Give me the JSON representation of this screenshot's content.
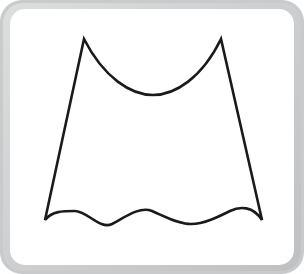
{
  "canvas": {
    "width": 304,
    "height": 274,
    "background_color": "#ffffff"
  },
  "frame": {
    "name": "rounded-card-frame",
    "border_color": "#c9cacb",
    "bevel_color_light": "#dcdddd",
    "bevel_color_dark": "#bfc0c1",
    "corner_radius": 22,
    "border_thickness": 10
  },
  "card": {
    "name": "white-card",
    "background_color": "#ffffff",
    "corner_radius": 15,
    "x": 10,
    "y": 9,
    "width": 284,
    "height": 256
  },
  "figure": {
    "name": "scalloped-flared-shape",
    "stroke_color": "#1a1a1a",
    "fill_color": "none",
    "stroke_width": 2.6,
    "points": {
      "top_left_peak": {
        "x": 84,
        "y": 39
      },
      "top_right_peak": {
        "x": 221,
        "y": 39
      },
      "top_arc_lowest": {
        "x": 153,
        "y": 82
      },
      "bottom_left_vertex": {
        "x": 45,
        "y": 220
      },
      "bottom_right_vertex": {
        "x": 262,
        "y": 220
      },
      "hem_hump_1": {
        "x": 75,
        "y": 211
      },
      "hem_trough_1": {
        "x": 112,
        "y": 224
      },
      "hem_hump_2": {
        "x": 152,
        "y": 211
      },
      "hem_trough_2": {
        "x": 191,
        "y": 224
      },
      "hem_hump_3": {
        "x": 230,
        "y": 211
      }
    },
    "counts": {
      "top_peaks": 2,
      "top_arcs": 1,
      "hem_humps": 3,
      "hem_troughs": 2,
      "straight_sides": 2
    },
    "path_d": "M 84 39 C 104 78, 131 95, 153 95 C 175 95, 202 78, 221 39 L 262 220 C 253 206, 240 206, 230 211 C 218 217, 204 224, 191 224 C 178 224, 164 216, 152 211 C 140 206, 125 217, 112 224 C 100 230, 87 211, 75 211 C 63 211, 52 211, 45 220 Z"
  }
}
